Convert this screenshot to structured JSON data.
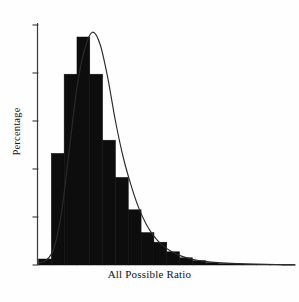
{
  "figure": {
    "background_color": "#fefefe",
    "ink_color": "#0d0d0d",
    "axis_color": "#3a3a3a",
    "curve_color": "#2b2b2b"
  },
  "axes": {
    "x_title": "All Possible Ratio",
    "y_title": "Percentage",
    "x_tick_labels": [],
    "y_tick_labels": [],
    "y_tick_count": 6,
    "grid": "off",
    "legend": "none"
  },
  "chart_data": {
    "type": "bar",
    "title": "",
    "subtitle": "",
    "xlabel": "All Possible Ratio",
    "ylabel": "Percentage",
    "xlim": [
      0,
      20
    ],
    "ylim": [
      0,
      100
    ],
    "grid": false,
    "legend_position": "none",
    "annotations": [],
    "categories": [
      "1",
      "2",
      "3",
      "4",
      "5",
      "6",
      "7",
      "8",
      "9",
      "10",
      "11",
      "12",
      "13",
      "14",
      "15",
      "16",
      "17",
      "18",
      "19",
      "20"
    ],
    "values": [
      2.5,
      46.5,
      79.5,
      95.0,
      79.5,
      52.0,
      36.5,
      23.0,
      13.5,
      9.5,
      5.5,
      3.0,
      1.8,
      1.0,
      0.6,
      0.4,
      0.3,
      0.2,
      0.15,
      0.1
    ],
    "series": [
      {
        "name": "Histogram",
        "type": "bar",
        "values": [
          2.5,
          46.5,
          79.5,
          95.0,
          79.5,
          52.0,
          36.5,
          23.0,
          13.5,
          9.5,
          5.5,
          3.0,
          1.8,
          1.0,
          0.6,
          0.4,
          0.3,
          0.2,
          0.15,
          0.1
        ]
      },
      {
        "name": "Density curve",
        "type": "line",
        "x": [
          0.0,
          0.6,
          1.2,
          1.8,
          2.4,
          3.0,
          3.6,
          4.2,
          4.8,
          5.4,
          6.0,
          6.6,
          7.2,
          7.8,
          8.4,
          9.0,
          9.6,
          10.4,
          11.2,
          12.0,
          13.0,
          14.0,
          15.5,
          17.0,
          18.5,
          20.0
        ],
        "values": [
          0.8,
          2.0,
          7.0,
          22.0,
          48.0,
          74.0,
          90.0,
          97.0,
          92.0,
          78.0,
          60.0,
          45.0,
          33.5,
          24.0,
          17.0,
          12.0,
          8.5,
          5.5,
          3.6,
          2.4,
          1.5,
          1.0,
          0.6,
          0.35,
          0.2,
          0.12
        ]
      }
    ]
  }
}
